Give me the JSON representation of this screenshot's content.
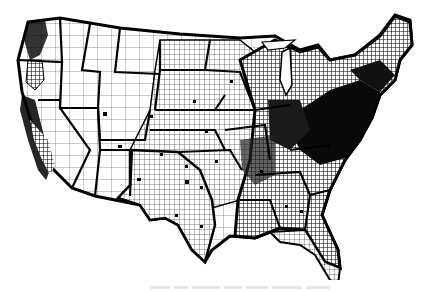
{
  "figure": {
    "type": "choropleth-map",
    "region": "Contiguous United States",
    "unit": "county",
    "style": "monochrome scan",
    "legend": "none visible",
    "caption_visible": false,
    "colors": {
      "border": "#000000",
      "shaded": "#111111",
      "background": "#ffffff",
      "caption": "#e6e6e6"
    }
  }
}
